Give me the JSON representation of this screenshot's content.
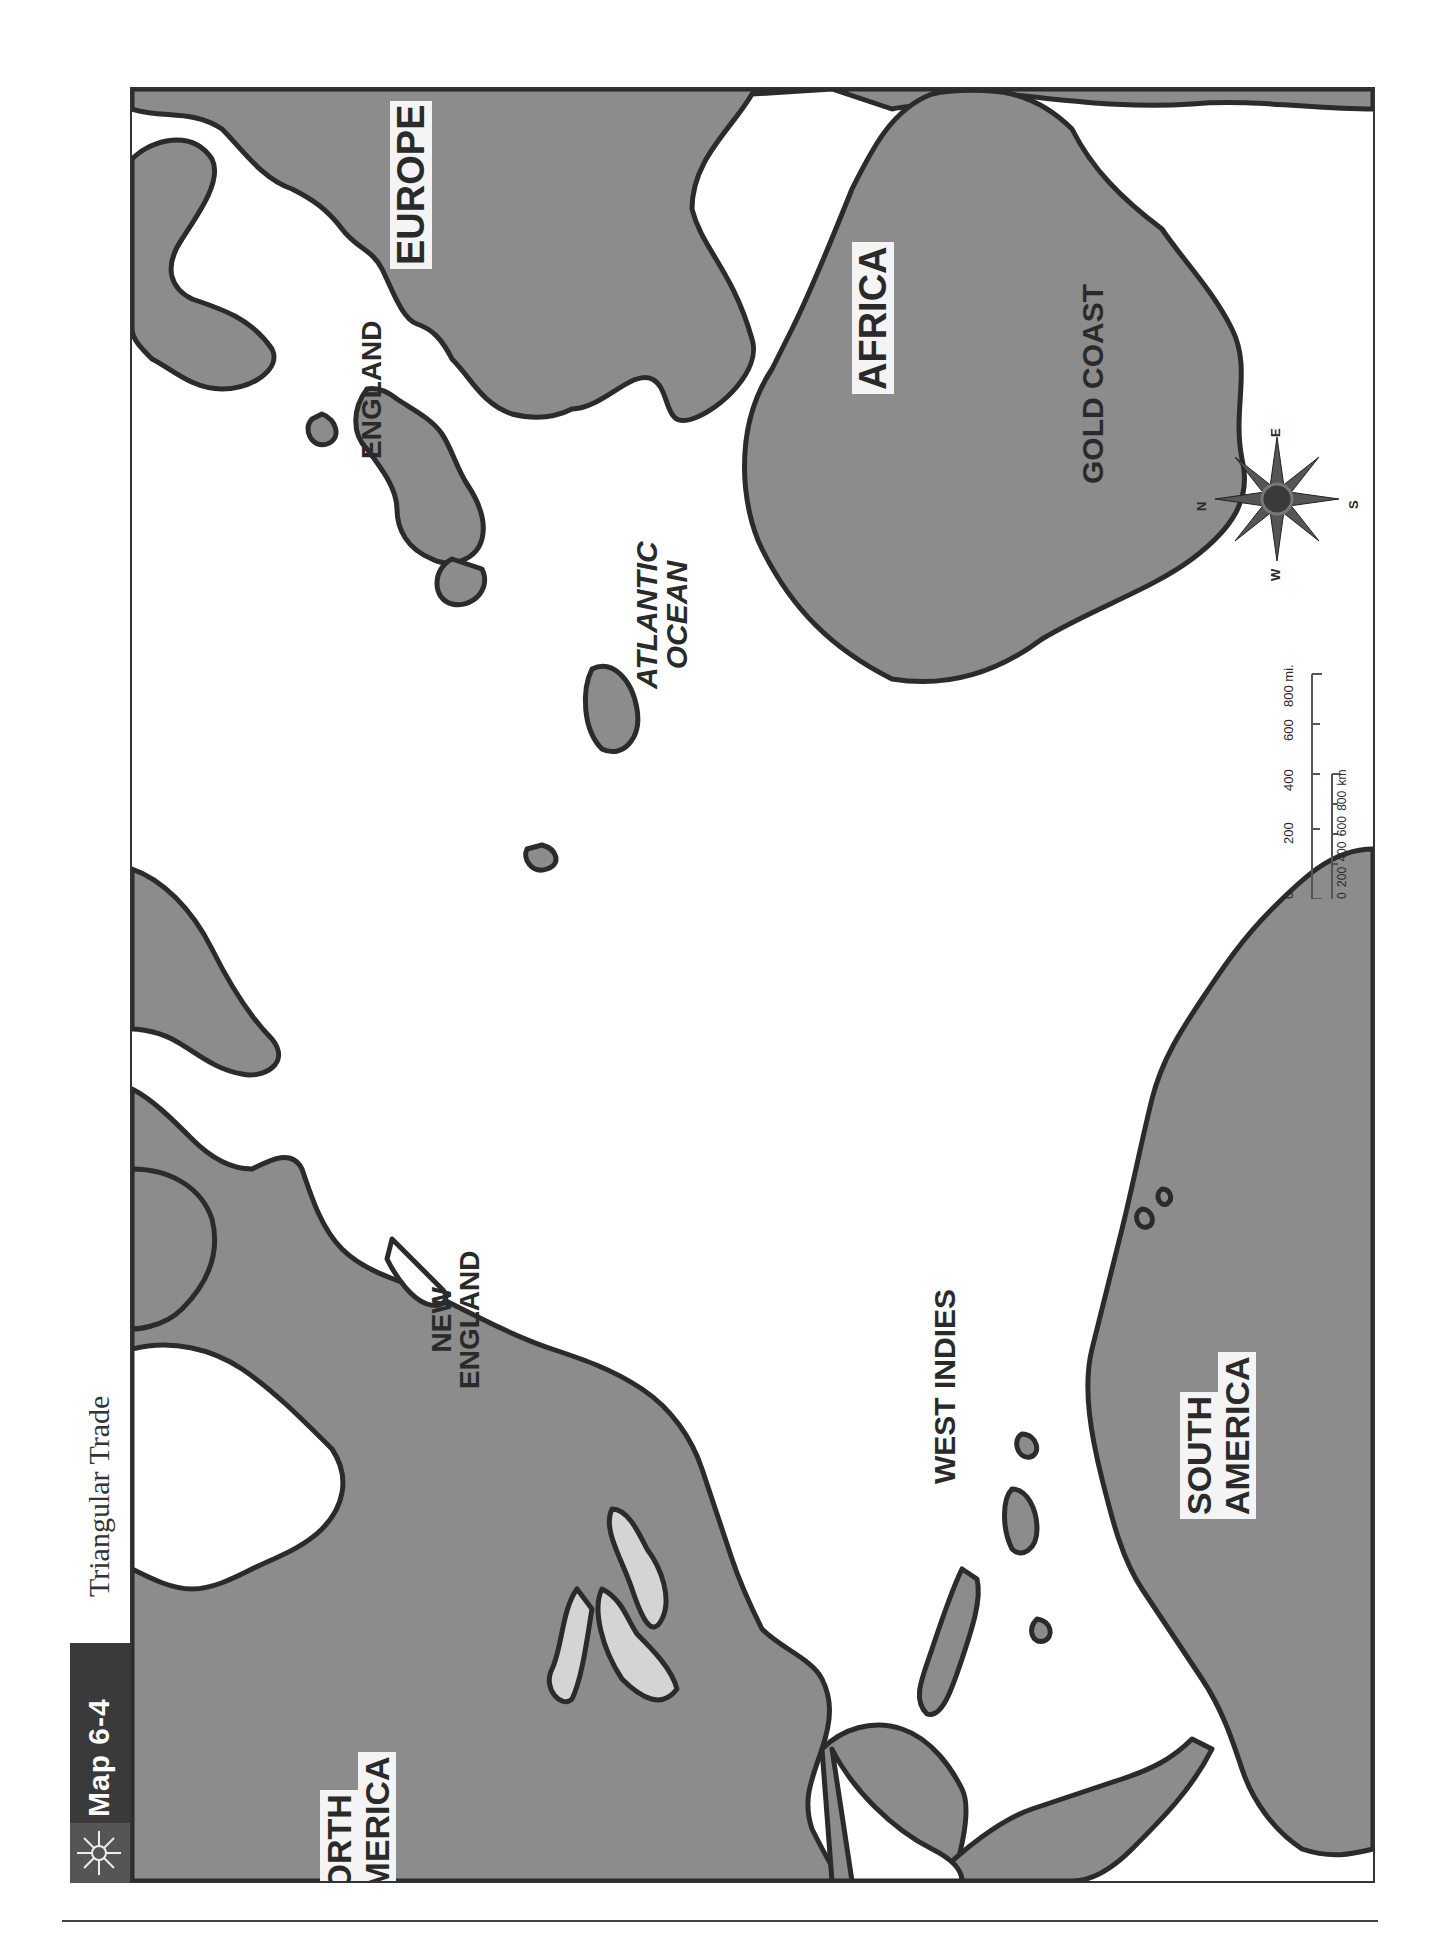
{
  "header": {
    "map_number": "Map 6-4",
    "title": "Triangular Trade",
    "icon": "compass-star-icon"
  },
  "labels": {
    "europe": "EUROPE",
    "england": "ENGLAND",
    "africa": "AFRICA",
    "gold_coast": "GOLD COAST",
    "atlantic_line1": "ATLANTIC",
    "atlantic_line2": "OCEAN",
    "new_england_line1": "NEW",
    "new_england_line2": "ENGLAND",
    "west_indies": "WEST INDIES",
    "north_america_line1": "NORTH",
    "north_america_line2": "AMERICA",
    "south_america_line1": "SOUTH",
    "south_america_line2": "AMERICA"
  },
  "compass": {
    "n": "N",
    "e": "E",
    "s": "S",
    "w": "W"
  },
  "scale": {
    "miles_ticks": [
      "0",
      "200",
      "400",
      "600",
      "800 mi."
    ],
    "km_ticks": [
      "0",
      "200",
      "400",
      "600",
      "800 km"
    ]
  },
  "colors": {
    "land": "#8c8c8c",
    "lakes": "#d4d4d4",
    "water": "#ffffff",
    "outline": "#2b2b2b",
    "title_bar": "#3a3a3a"
  }
}
